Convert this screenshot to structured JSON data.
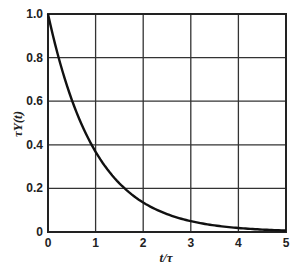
{
  "chart_data": {
    "type": "line",
    "title": "",
    "xlabel": "t/τ",
    "ylabel": "τY(t)",
    "xlim": [
      0,
      5
    ],
    "ylim": [
      0,
      1.0
    ],
    "grid": true,
    "legend": null,
    "x_ticks": [
      "0",
      "1",
      "2",
      "3",
      "4",
      "5"
    ],
    "y_ticks": [
      "0",
      "0.2",
      "0.4",
      "0.6",
      "0.8",
      "1.0"
    ],
    "series": [
      {
        "name": "τY(t) = exp(-t/τ)",
        "x": [
          0,
          0.25,
          0.5,
          0.75,
          1.0,
          1.5,
          2.0,
          2.5,
          3.0,
          3.5,
          4.0,
          4.5,
          5.0
        ],
        "values": [
          1.0,
          0.78,
          0.61,
          0.47,
          0.37,
          0.22,
          0.14,
          0.08,
          0.05,
          0.03,
          0.02,
          0.01,
          0.007
        ]
      }
    ]
  }
}
